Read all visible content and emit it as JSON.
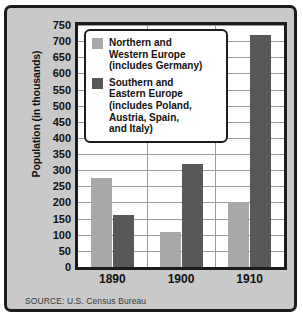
{
  "chart_data": {
    "type": "bar",
    "title": "",
    "xlabel": "",
    "ylabel": "Population (in thousands)",
    "categories": [
      "1890",
      "1900",
      "1910"
    ],
    "series": [
      {
        "name": "Northern and\nWestern Europe\n(includes Germany)",
        "color": "#a8a8a8",
        "values": [
          275,
          110,
          200
        ]
      },
      {
        "name": "Southern and\nEastern Europe\n(includes Poland,\nAustria, Spain,\nand Italy)",
        "color": "#585858",
        "values": [
          160,
          320,
          720
        ]
      }
    ],
    "ylim": [
      0,
      750
    ],
    "ytick_step": 50,
    "yticks": [
      "750",
      "700",
      "650",
      "600",
      "550",
      "500",
      "450",
      "400",
      "350",
      "300",
      "250",
      "200",
      "150",
      "100",
      "50",
      "0"
    ],
    "grid": "horizontal-and-vertical",
    "legend_position": "top-left-inside"
  },
  "legend": {
    "entries": [
      {
        "label": "Northern and\nWestern Europe\n(includes Germany)",
        "swatch": "light-gray-swatch"
      },
      {
        "label": "Southern and\nEastern Europe\n(includes Poland,\nAustria, Spain,\nand Italy)",
        "swatch": "dark-gray-swatch"
      }
    ]
  },
  "footer": {
    "source": "SOURCE: U.S. Census Bureau"
  },
  "colors": {
    "series_light": "#a8a8a8",
    "series_dark": "#585858",
    "frame": "#1c1c1c",
    "background": "#c9c9c9",
    "plot_background": "#ffffff",
    "gridline": "#9a9a9a"
  }
}
